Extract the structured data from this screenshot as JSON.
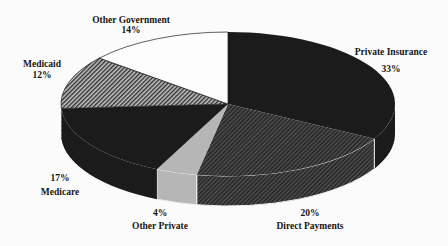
{
  "chart_data": {
    "type": "pie",
    "style": "3d-exploded-none",
    "title": "",
    "start_angle_deg": 90,
    "direction": "clockwise",
    "slices": [
      {
        "label": "Private Insurance",
        "value": 33,
        "pct_label": "33%",
        "fill": "solid-black",
        "label_pos": {
          "x": 391,
          "name_y": 53,
          "pct_y": 70
        }
      },
      {
        "label": "Direct Payments",
        "value": 20,
        "pct_label": "20%",
        "fill": "dark-crosshatch",
        "label_pos": {
          "x": 310,
          "name_y": 227,
          "pct_y": 214
        }
      },
      {
        "label": "Other Private",
        "value": 4,
        "pct_label": "4%",
        "fill": "light-gray",
        "label_pos": {
          "x": 160,
          "name_y": 227,
          "pct_y": 214
        }
      },
      {
        "label": "Medicare",
        "value": 17,
        "pct_label": "17%",
        "fill": "solid-black",
        "label_pos": {
          "x": 60,
          "name_y": 193,
          "pct_y": 179
        }
      },
      {
        "label": "Medicaid",
        "value": 12,
        "pct_label": "12%",
        "fill": "diagonal-hatch",
        "label_pos": {
          "x": 42,
          "name_y": 65,
          "pct_y": 76
        }
      },
      {
        "label": "Other Government",
        "value": 14,
        "pct_label": "14%",
        "fill": "white",
        "label_pos": {
          "x": 131,
          "name_y": 21,
          "pct_y": 31
        }
      }
    ],
    "colors": {
      "black": "#1b1b1b",
      "light_gray": "#b6b6b6",
      "white": "#fdfdfd",
      "hatch_bg": "#c4c4c4",
      "hatch_line": "#2f2f2f",
      "crosshatch_bg": "#292929",
      "crosshatch_line": "#565656",
      "edge_white": "#efefef",
      "outline": "#1b1b1b"
    },
    "geometry": {
      "cx": 228,
      "cy": 104,
      "rx": 167,
      "ry": 72,
      "depth": 30
    },
    "legend": "none",
    "labels_placement": "outside-two-line"
  }
}
